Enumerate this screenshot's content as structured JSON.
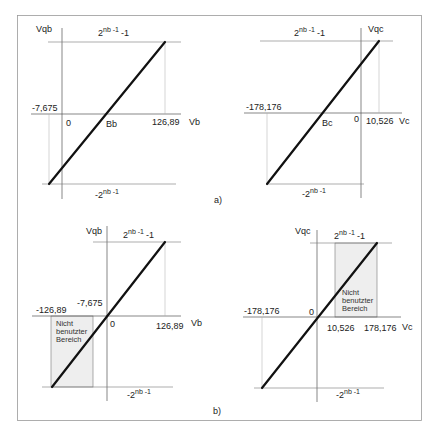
{
  "figure": {
    "panel_labels": {
      "a": "a)",
      "b": "b)"
    },
    "shaded_region_label": [
      "Nicht",
      "benutzter",
      "Bereich"
    ],
    "top_level": {
      "base": "2",
      "exp": "nb -1",
      "suffix": "-1"
    },
    "bottom_level": {
      "prefix": "-",
      "base": "2",
      "exp": "nb -1"
    }
  },
  "panels": {
    "a_left": {
      "y_axis": "Vqb",
      "x_axis": "Vb",
      "origin": "0",
      "intercept_label": "Bb",
      "x_min_label": "-7,675",
      "x_max_label": "126,89"
    },
    "a_right": {
      "y_axis": "Vqc",
      "x_axis": "Vc",
      "origin": "0",
      "intercept_label": "Bc",
      "x_min_label": "-178,176",
      "x_max_label": "10,526"
    },
    "b_left": {
      "y_axis": "Vqb",
      "x_axis": "Vb",
      "origin": "0",
      "x_min_label": "-126,89",
      "x_offset_label": "-7,675",
      "x_max_label": "126,89"
    },
    "b_right": {
      "y_axis": "Vqc",
      "x_axis": "Vc",
      "origin": "0",
      "x_min_label": "-178,176",
      "x_offset_label": "10,526",
      "x_max_label": "178,176"
    }
  },
  "colors": {
    "line": "#111111",
    "shade": "#eeeeee",
    "frame": "#999999"
  }
}
